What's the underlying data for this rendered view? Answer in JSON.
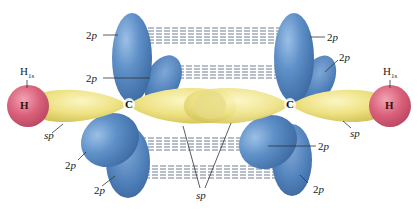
{
  "diagram": {
    "colors": {
      "p_orbital": "#5a8cc4",
      "p_orbital_dark": "#3f6ea8",
      "sp_orbital": "#efe48a",
      "sp_orbital_dark": "#d9c95a",
      "hydrogen": "#d9607a",
      "dash_lines": "#4a5a70",
      "leader_lines": "#333333"
    },
    "atoms": {
      "left_h": {
        "symbol": "H",
        "orbital_label": "H",
        "orbital_sub": "1s"
      },
      "right_h": {
        "symbol": "H",
        "orbital_label": "H",
        "orbital_sub": "1s"
      },
      "left_c": {
        "symbol": "C"
      },
      "right_c": {
        "symbol": "C"
      }
    },
    "labels": {
      "p_upper_left_front": "2p",
      "p_upper_left_back": "2p",
      "p_upper_right_front": "2p",
      "p_upper_right_back": "2p",
      "p_lower_left_front": "2p",
      "p_lower_left_back": "2p",
      "p_lower_right_front": "2p",
      "p_lower_right_back": "2p",
      "sp_left": "sp",
      "sp_right": "sp",
      "sp_center": "sp"
    }
  }
}
